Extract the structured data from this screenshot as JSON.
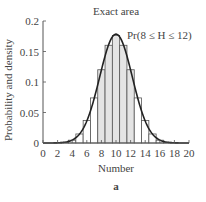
{
  "chart_data": {
    "type": "bar",
    "title": "Exact area",
    "xlabel": "Number",
    "ylabel": "Probability and density",
    "panel_label": "a",
    "annotation": "Pr(8 ≤ H ≤ 12)",
    "xlim": [
      0,
      20
    ],
    "ylim": [
      0,
      0.2
    ],
    "x_ticks": [
      0,
      2,
      4,
      6,
      8,
      10,
      12,
      14,
      16,
      18,
      20
    ],
    "x_tick_labels": [
      "0",
      "2",
      "4",
      "6",
      "8",
      "10",
      "12",
      "14",
      "16",
      "18",
      "20"
    ],
    "y_ticks": [
      0,
      0.05,
      0.1,
      0.15,
      0.2
    ],
    "y_tick_labels": [
      "0",
      "0.05",
      "0.1",
      "0.15",
      "0.2"
    ],
    "grid": false,
    "categories": [
      0,
      1,
      2,
      3,
      4,
      5,
      6,
      7,
      8,
      9,
      10,
      11,
      12,
      13,
      14,
      15,
      16,
      17,
      18,
      19,
      20
    ],
    "series": [
      {
        "name": "Binomial probability (histogram)",
        "values": [
          0.0,
          0.0,
          0.0002,
          0.0011,
          0.0046,
          0.0148,
          0.037,
          0.0739,
          0.1201,
          0.1602,
          0.1762,
          0.1602,
          0.1201,
          0.0739,
          0.037,
          0.0148,
          0.0046,
          0.0011,
          0.0002,
          0.0,
          0.0
        ]
      },
      {
        "name": "Normal density curve",
        "type": "line",
        "mean": 10,
        "sd": 2.236
      }
    ],
    "shaded_range": [
      8,
      12
    ],
    "colors": {
      "bar_fill": "#ffffff",
      "bar_shaded_fill": "#e4e4e4",
      "bar_stroke": "#555555",
      "curve": "#222222",
      "axis": "#555555"
    }
  }
}
